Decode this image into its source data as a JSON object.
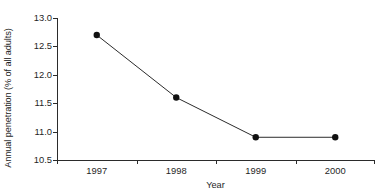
{
  "chart_data": {
    "type": "line",
    "title": "",
    "subtitle": "",
    "xlabel": "Year",
    "ylabel": "Annual penetration (% of all adults)",
    "categories": [
      "1997",
      "1998",
      "1999",
      "2000"
    ],
    "values": [
      12.7,
      11.6,
      10.9,
      10.9
    ],
    "series": [
      {
        "name": "Annual penetration",
        "values": [
          12.7,
          11.6,
          10.9,
          10.9
        ]
      }
    ],
    "ylim": [
      10.5,
      13.0
    ],
    "ytick_labels": [
      "13.0",
      "12.5",
      "12.0",
      "11.5",
      "11.0",
      "10.5"
    ],
    "ytick_values": [
      13.0,
      12.5,
      12.0,
      11.5,
      11.0,
      10.5
    ],
    "xtick_labels": [
      "1997",
      "1998",
      "1999",
      "2000"
    ],
    "grid": false,
    "legend": false,
    "legend_position": "none",
    "marker": "filled-circle",
    "line_color": "#2b2b2b",
    "marker_color": "#111111",
    "background_color": "#ffffff",
    "axis_color": "#2b2b2b"
  }
}
